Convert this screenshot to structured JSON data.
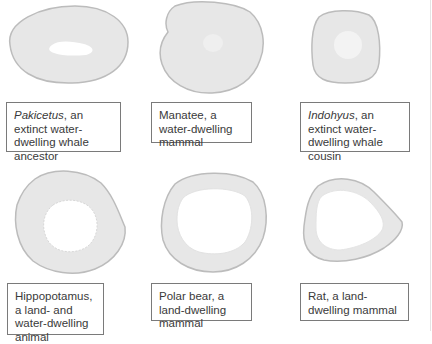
{
  "figure": {
    "panels": [
      {
        "id": "pakicetus",
        "italic_name": "Pakicetus",
        "caption_rest": ", an extinct water-dwelling whale ancestor",
        "bone": "dense-ellipse-small-cavity"
      },
      {
        "id": "manatee",
        "italic_name": "",
        "caption_rest": "Manatee, a water-dwelling mammal",
        "bone": "dense-solid"
      },
      {
        "id": "indohyus",
        "italic_name": "Indohyus",
        "caption_rest": ", an extinct water-dwelling whale cousin",
        "bone": "dense-small-cavity"
      },
      {
        "id": "hippopotamus",
        "italic_name": "",
        "caption_rest": "Hippopotamus, a land- and water-dwelling animal",
        "bone": "medium-cavity"
      },
      {
        "id": "polar-bear",
        "italic_name": "",
        "caption_rest": "Polar bear, a land-dwelling mammal",
        "bone": "large-cavity"
      },
      {
        "id": "rat",
        "italic_name": "",
        "caption_rest": "Rat, a land-dwelling mammal",
        "bone": "large-cavity"
      }
    ],
    "colors": {
      "bone_fill": "#e6e6e6",
      "bone_edge": "#bdbdbd",
      "cavity": "#ffffff",
      "box_border": "#7a7a7a",
      "text": "#3a3a3a"
    }
  }
}
